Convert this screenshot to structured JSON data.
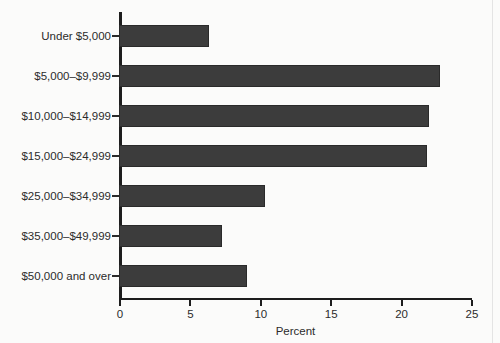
{
  "chart_data": {
    "type": "bar",
    "orientation": "horizontal",
    "title": "",
    "xlabel": "Percent",
    "ylabel": "",
    "categories": [
      "Under $5,000",
      "$5,000–$9,999",
      "$10,000–$14,999",
      "$15,000–$24,999",
      "$25,000–$34,999",
      "$35,000–$49,999",
      "$50,000 and over"
    ],
    "values": [
      6.4,
      22.8,
      22.0,
      21.9,
      10.4,
      7.3,
      9.1
    ],
    "xlim": [
      0,
      25
    ],
    "xticks": [
      0,
      5,
      10,
      15,
      20,
      25
    ],
    "xtick_labels": [
      "0",
      "5",
      "10",
      "15",
      "20",
      "25"
    ],
    "grid": false,
    "legend": null,
    "bar_color": "#3c3c3c",
    "axis_color": "#1d1d1d",
    "background_color": "#fbfbfa"
  }
}
